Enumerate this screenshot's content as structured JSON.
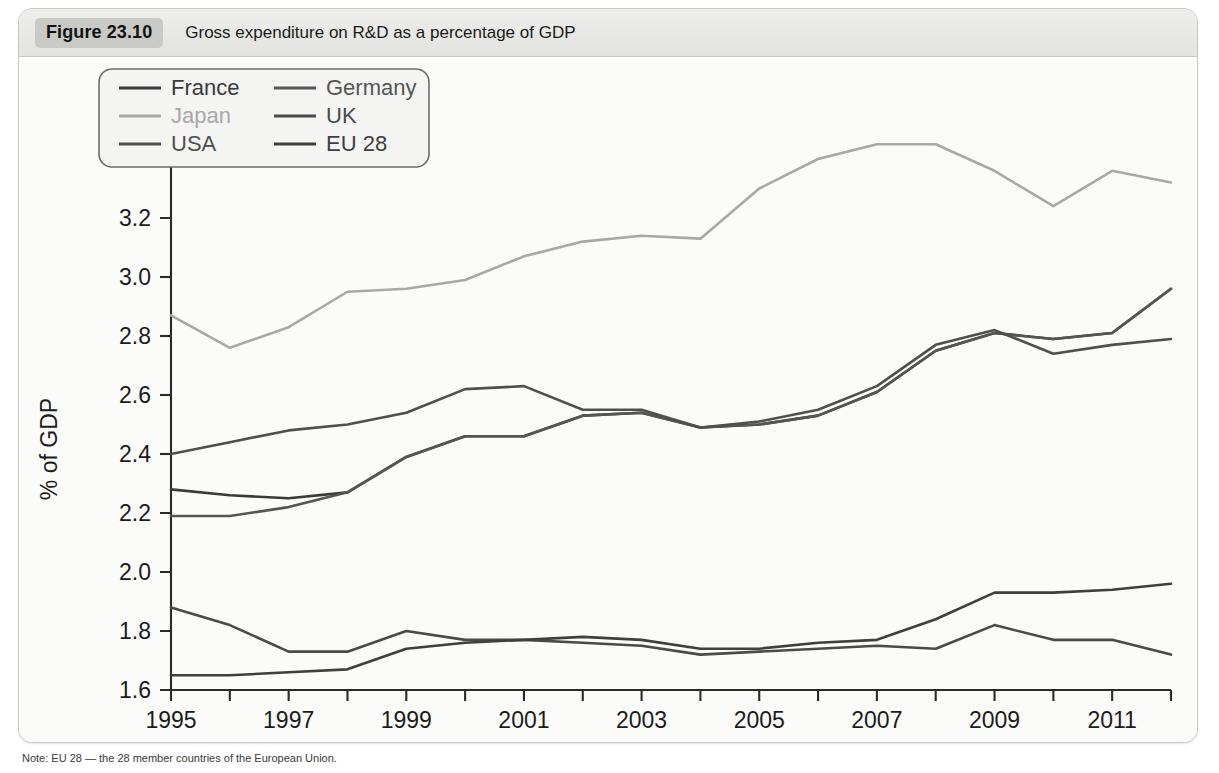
{
  "figure": {
    "number_label": "Figure 23.10",
    "caption": "Gross expenditure on R&D as a percentage of GDP",
    "note": "Note: EU 28 — the 28 member countries of the European Union."
  },
  "chart_data": {
    "type": "line",
    "title": "Gross expenditure on R&D as a percentage of GDP",
    "xlabel": "",
    "ylabel": "% of GDP",
    "xlim": [
      1995,
      2012
    ],
    "ylim": [
      1.6,
      3.6
    ],
    "ytick_step": 0.2,
    "grid": false,
    "legend_position": "top-left-inside",
    "x": [
      1995,
      1996,
      1997,
      1998,
      1999,
      2000,
      2001,
      2002,
      2003,
      2004,
      2005,
      2006,
      2007,
      2008,
      2009,
      2010,
      2011,
      2012
    ],
    "xtick_labels": [
      "1995",
      "1997",
      "1999",
      "2001",
      "2003",
      "2005",
      "2007",
      "2009",
      "2011"
    ],
    "ytick_labels": [
      "1.6",
      "1.8",
      "2.0",
      "2.2",
      "2.4",
      "2.6",
      "2.8",
      "3.0",
      "3.2",
      "3.4",
      "3.6"
    ],
    "series": [
      {
        "name": "France",
        "color": "#3a3a3a",
        "values": [
          2.28,
          2.26,
          2.25,
          2.27,
          2.39,
          2.46,
          2.46,
          2.53,
          2.54,
          2.49,
          2.5,
          2.53,
          2.61,
          2.75,
          2.81,
          2.79,
          2.81,
          2.96
        ]
      },
      {
        "name": "Germany",
        "color": "#555555",
        "values": [
          2.19,
          2.19,
          2.22,
          2.27,
          2.39,
          2.46,
          2.46,
          2.53,
          2.54,
          2.49,
          2.5,
          2.53,
          2.61,
          2.75,
          2.81,
          2.79,
          2.81,
          2.96
        ]
      },
      {
        "name": "Japan",
        "color": "#a8a8a8",
        "values": [
          2.87,
          2.76,
          2.83,
          2.95,
          2.96,
          2.99,
          3.07,
          3.12,
          3.14,
          3.13,
          3.3,
          3.4,
          3.45,
          3.45,
          3.36,
          3.24,
          3.36,
          3.32
        ]
      },
      {
        "name": "UK",
        "color": "#4a4a4a",
        "values": [
          1.88,
          1.82,
          1.73,
          1.73,
          1.8,
          1.77,
          1.77,
          1.76,
          1.75,
          1.72,
          1.73,
          1.74,
          1.75,
          1.74,
          1.82,
          1.77,
          1.77,
          1.72
        ]
      },
      {
        "name": "USA",
        "color": "#4f4f4f",
        "values": [
          2.4,
          2.44,
          2.48,
          2.5,
          2.54,
          2.62,
          2.63,
          2.55,
          2.55,
          2.49,
          2.51,
          2.55,
          2.63,
          2.77,
          2.82,
          2.74,
          2.77,
          2.79
        ]
      },
      {
        "name": "EU 28",
        "color": "#3f3f3f",
        "values": [
          1.65,
          1.65,
          1.66,
          1.67,
          1.74,
          1.76,
          1.77,
          1.78,
          1.77,
          1.74,
          1.74,
          1.76,
          1.77,
          1.84,
          1.93,
          1.93,
          1.94,
          1.96
        ]
      }
    ]
  },
  "legend": {
    "entries": [
      {
        "label": "France",
        "color": "#3a3a3a"
      },
      {
        "label": "Germany",
        "color": "#555555"
      },
      {
        "label": "Japan",
        "color": "#a8a8a8"
      },
      {
        "label": "UK",
        "color": "#4a4a4a"
      },
      {
        "label": "USA",
        "color": "#4f4f4f"
      },
      {
        "label": "EU 28",
        "color": "#3f3f3f"
      }
    ]
  }
}
